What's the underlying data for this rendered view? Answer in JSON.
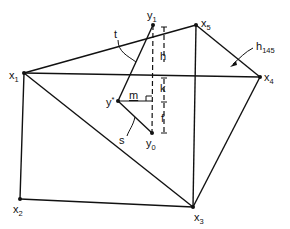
{
  "diagram": {
    "type": "geometric-construction",
    "colors": {
      "ink": "#111111",
      "background": "#ffffff"
    },
    "vertices": [
      {
        "id": "x1",
        "label": "x",
        "sub": "1",
        "x": 24,
        "y": 73
      },
      {
        "id": "x2",
        "label": "x",
        "sub": "2",
        "x": 20,
        "y": 199
      },
      {
        "id": "x3",
        "label": "x",
        "sub": "3",
        "x": 193,
        "y": 207
      },
      {
        "id": "x4",
        "label": "x",
        "sub": "4",
        "x": 260,
        "y": 77
      },
      {
        "id": "x5",
        "label": "x",
        "sub": "5",
        "x": 196,
        "y": 25
      }
    ],
    "points": [
      {
        "id": "y1",
        "label": "y",
        "sub": "1",
        "x": 153,
        "y": 25
      },
      {
        "id": "y0",
        "label": "y",
        "sub": "0",
        "x": 152,
        "y": 133
      },
      {
        "id": "ystar",
        "label": "y",
        "sub": "*",
        "x": 118,
        "y": 101
      }
    ],
    "edges": [
      [
        "x1",
        "x5"
      ],
      [
        "x5",
        "x4"
      ],
      [
        "x1",
        "x4"
      ],
      [
        "x1",
        "x2"
      ],
      [
        "x2",
        "x3"
      ],
      [
        "x1",
        "x3"
      ],
      [
        "x3",
        "x4"
      ],
      [
        "x5",
        "x3"
      ],
      [
        "ystar",
        "y1"
      ],
      [
        "ystar",
        "y0"
      ]
    ],
    "labels": {
      "t": "t",
      "s": "s",
      "m": "m",
      "h": "h",
      "k": "k",
      "f": "f",
      "h145": "h",
      "h145_sub": "145",
      "x1": "x",
      "x1_sub": "1",
      "x2": "x",
      "x2_sub": "2",
      "x3": "x",
      "x3_sub": "3",
      "x4": "x",
      "x4_sub": "4",
      "x5": "x",
      "x5_sub": "5",
      "y1": "y",
      "y1_sub": "1",
      "y0": "y",
      "y0_sub": "0",
      "ystar": "y",
      "ystar_sub": "*"
    }
  }
}
